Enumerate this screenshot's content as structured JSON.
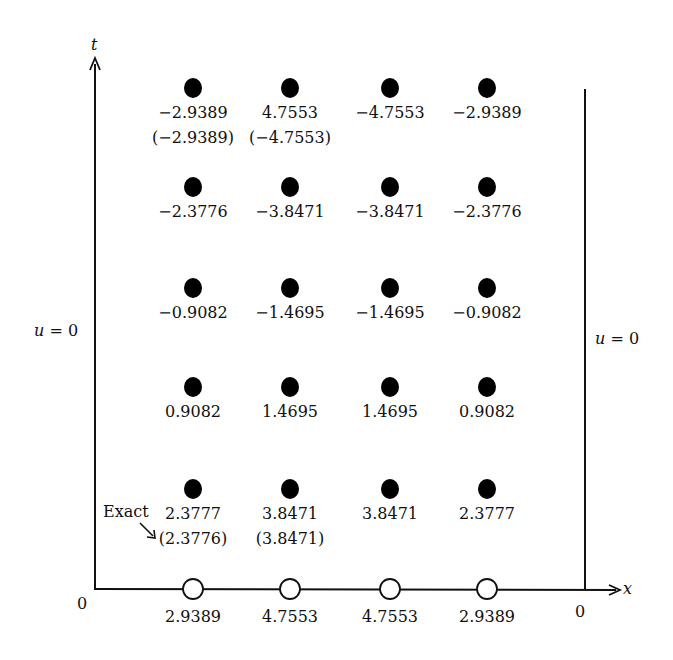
{
  "axes": {
    "t_label": "t",
    "x_label": "x",
    "origin_left": "0",
    "origin_right": "0"
  },
  "boundary": {
    "left": "u = 0",
    "right": "u = 0"
  },
  "annotation": {
    "exact_label": "Exact"
  },
  "grid": {
    "columns_x": [
      193,
      290,
      390,
      487
    ],
    "rows": [
      {
        "y": 88,
        "values": [
          "−2.9389",
          "4.7553",
          "−4.7553",
          "−2.9389"
        ],
        "exact": [
          "(−2.9389)",
          "(−4.7553)",
          "",
          ""
        ]
      },
      {
        "y": 187,
        "values": [
          "−2.3776",
          "−3.8471",
          "−3.8471",
          "−2.3776"
        ],
        "exact": [
          "",
          "",
          "",
          ""
        ]
      },
      {
        "y": 288,
        "values": [
          "−0.9082",
          "−1.4695",
          "−1.4695",
          "−0.9082"
        ],
        "exact": [
          "",
          "",
          "",
          ""
        ]
      },
      {
        "y": 387,
        "values": [
          "0.9082",
          "1.4695",
          "1.4695",
          "0.9082"
        ],
        "exact": [
          "",
          "",
          "",
          ""
        ]
      },
      {
        "y": 489,
        "values": [
          "2.3777",
          "3.8471",
          "3.8471",
          "2.3777"
        ],
        "exact": [
          "(2.3776)",
          "(3.8471)",
          "",
          ""
        ]
      }
    ],
    "initial_row": {
      "y": 590,
      "values": [
        "2.9389",
        "4.7553",
        "4.7553",
        "2.9389"
      ]
    }
  },
  "chart_data": {
    "type": "scatter",
    "title": "",
    "xlabel": "x",
    "ylabel": "t",
    "initial_values_t0": [
      2.9389,
      4.7553,
      4.7553,
      2.9389
    ],
    "computed_rows_bottom_to_top": [
      [
        2.3777,
        3.8471,
        3.8471,
        2.3777
      ],
      [
        0.9082,
        1.4695,
        1.4695,
        0.9082
      ],
      [
        -0.9082,
        -1.4695,
        -1.4695,
        -0.9082
      ],
      [
        -2.3776,
        -3.8471,
        -3.8471,
        -2.3776
      ],
      [
        -2.9389,
        4.7553,
        -4.7553,
        -2.9389
      ]
    ],
    "exact_values": [
      {
        "row": 1,
        "col": 1,
        "value": 2.3776
      },
      {
        "row": 1,
        "col": 2,
        "value": 3.8471
      },
      {
        "row": 5,
        "col": 1,
        "value": -2.9389
      },
      {
        "row": 5,
        "col": 2,
        "value": -4.7553
      }
    ],
    "boundary_conditions": {
      "left": "u = 0",
      "right": "u = 0"
    }
  }
}
